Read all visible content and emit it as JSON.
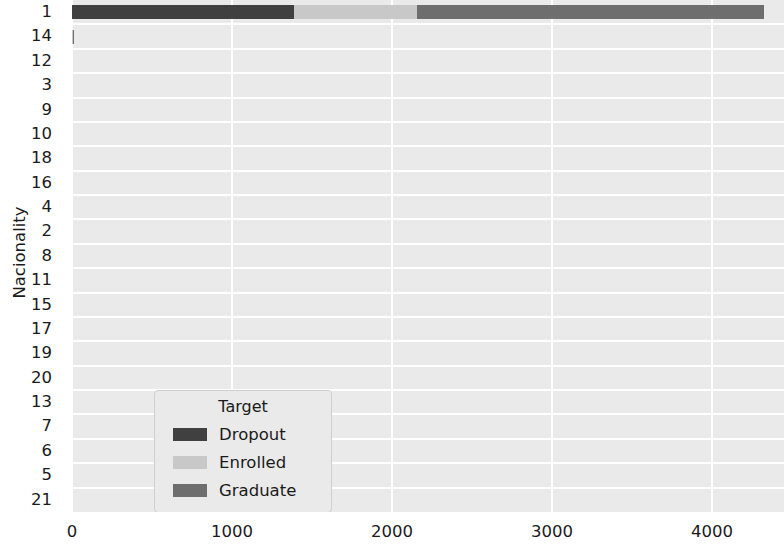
{
  "chart_data": {
    "type": "bar",
    "orientation": "horizontal",
    "stacked": true,
    "title": "",
    "xlabel": "",
    "ylabel": "Nacionality",
    "categories": [
      "1",
      "14",
      "12",
      "3",
      "9",
      "10",
      "18",
      "16",
      "4",
      "2",
      "8",
      "11",
      "15",
      "17",
      "19",
      "20",
      "13",
      "7",
      "6",
      "5",
      "21"
    ],
    "series": [
      {
        "name": "Dropout",
        "color": "#404040",
        "values": [
          1390,
          3,
          0,
          0,
          0,
          0,
          0,
          0,
          0,
          0,
          0,
          0,
          0,
          0,
          0,
          0,
          0,
          0,
          0,
          0,
          0
        ]
      },
      {
        "name": "Enrolled",
        "color": "#c8c8c8",
        "values": [
          765,
          1,
          0,
          0,
          0,
          0,
          0,
          0,
          0,
          0,
          0,
          0,
          0,
          0,
          0,
          0,
          0,
          0,
          0,
          0,
          0
        ]
      },
      {
        "name": "Graduate",
        "color": "#6e6e6e",
        "values": [
          2170,
          2,
          0,
          0,
          0,
          0,
          0,
          0,
          0,
          0,
          0,
          0,
          0,
          0,
          0,
          0,
          0,
          0,
          0,
          0,
          0
        ]
      }
    ],
    "xticks": [
      0,
      1000,
      2000,
      3000,
      4000
    ],
    "xtick_labels": [
      "0",
      "1000",
      "2000",
      "3000",
      "4000"
    ],
    "xlim": [
      0,
      4450
    ],
    "grid": true,
    "legend": {
      "title": "Target",
      "position": "lower left",
      "entries": [
        {
          "label": "Dropout",
          "color": "#404040"
        },
        {
          "label": "Enrolled",
          "color": "#c8c8c8"
        },
        {
          "label": "Graduate",
          "color": "#6e6e6e"
        }
      ]
    },
    "plot_background": "#eaeaea",
    "grid_color": "#ffffff"
  }
}
